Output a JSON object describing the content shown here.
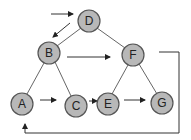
{
  "diagram": {
    "type": "binary-tree-traversal",
    "nodes": [
      {
        "id": "D",
        "label": "D",
        "x": 89,
        "y": 21
      },
      {
        "id": "B",
        "label": "B",
        "x": 49,
        "y": 53
      },
      {
        "id": "F",
        "label": "F",
        "x": 133,
        "y": 55
      },
      {
        "id": "A",
        "label": "A",
        "x": 22,
        "y": 104
      },
      {
        "id": "C",
        "label": "C",
        "x": 76,
        "y": 106
      },
      {
        "id": "E",
        "label": "E",
        "x": 108,
        "y": 104
      },
      {
        "id": "G",
        "label": "G",
        "x": 162,
        "y": 103
      }
    ],
    "tree_edges": [
      [
        "D",
        "B"
      ],
      [
        "D",
        "F"
      ],
      [
        "B",
        "A"
      ],
      [
        "B",
        "C"
      ],
      [
        "F",
        "E"
      ],
      [
        "F",
        "G"
      ]
    ],
    "traversal_arrows": [
      {
        "from": "entry",
        "to": "D"
      },
      {
        "from": "D",
        "to": "B"
      },
      {
        "from": "B",
        "to": "F"
      },
      {
        "from": "A",
        "to": "C"
      },
      {
        "from": "C",
        "to": "E"
      },
      {
        "from": "E",
        "to": "G"
      },
      {
        "from": "F",
        "to": "A",
        "style": "wrap-around"
      }
    ],
    "colors": {
      "node_fill": "#b8b8b8",
      "node_stroke": "#555555",
      "edge": "#555555",
      "arrow": "#333333",
      "background": "#ffffff"
    }
  }
}
